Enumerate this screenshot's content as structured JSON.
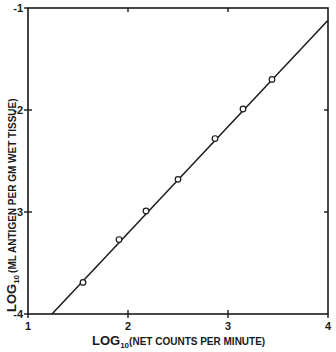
{
  "chart_data": {
    "type": "scatter",
    "title": "",
    "xlabel": {
      "prefix": "LOG",
      "subscript": "10",
      "text": "(NET COUNTS PER MINUTE)"
    },
    "ylabel": {
      "prefix": "LOG",
      "subscript": "10",
      "text": "(ML ANTIGEN PER GM WET TISSUE)"
    },
    "xlim": [
      1,
      4
    ],
    "ylim": [
      -4,
      -1
    ],
    "xticks": [
      1,
      2,
      3,
      4
    ],
    "yticks": [
      -4,
      -3,
      -2,
      -1
    ],
    "xtick_labels": [
      "1",
      "2",
      "3",
      "4"
    ],
    "ytick_labels": [
      "-4",
      "-3",
      "-2",
      "-1"
    ],
    "grid": false,
    "legend": null,
    "series": [
      {
        "name": "data",
        "marker": "open-circle",
        "x": [
          1.55,
          1.91,
          2.18,
          2.5,
          2.87,
          3.15,
          3.44
        ],
        "y": [
          -3.69,
          -3.27,
          -2.99,
          -2.68,
          -2.28,
          -1.99,
          -1.7
        ]
      }
    ],
    "fit_line": {
      "name": "linear fit",
      "x": [
        1.24,
        4.0
      ],
      "y": [
        -4.0,
        -1.12
      ]
    }
  },
  "colors": {
    "ink": "#1a1a1a",
    "background": "#ffffff"
  }
}
